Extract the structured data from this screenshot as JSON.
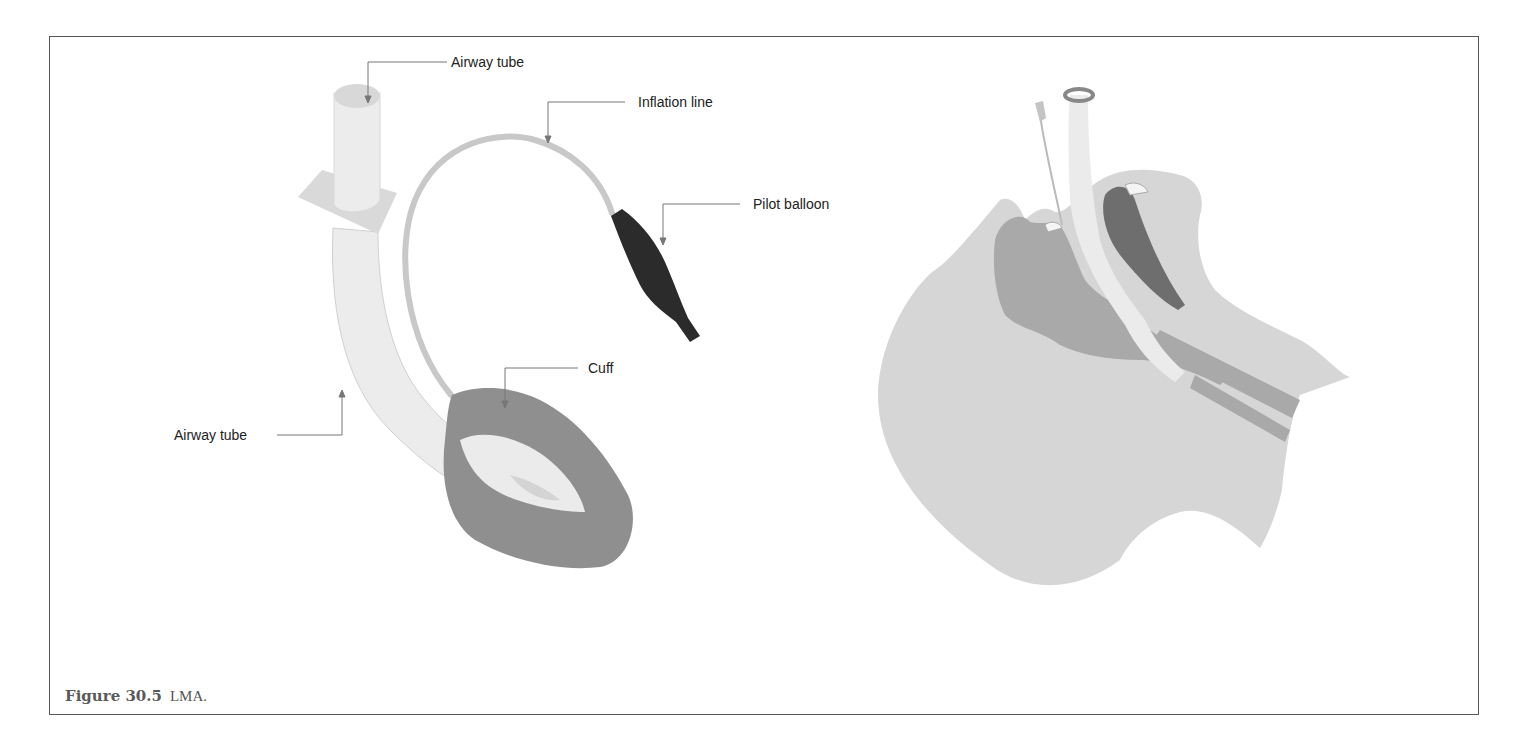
{
  "figure": {
    "number_label": "Figure 30.5",
    "caption_text": "LMA."
  },
  "device_labels": {
    "airway_tube_top": "Airway tube",
    "inflation_line": "Inflation line",
    "pilot_balloon": "Pilot balloon",
    "cuff": "Cuff",
    "airway_tube_side": "Airway tube"
  },
  "colors": {
    "frame_border": "#555555",
    "tube_fill": "#ececec",
    "flange_fill": "#d9d9d9",
    "inflation_line": "#c8c8c8",
    "pilot_balloon": "#2b2b2b",
    "cuff_fill": "#8f8f8f",
    "cuff_inner": "#ebebeb",
    "head_fill": "#d6d6d6",
    "tissue_mid": "#a9a9a9",
    "tissue_dark": "#6e6e6e",
    "leader_line": "#777777"
  }
}
